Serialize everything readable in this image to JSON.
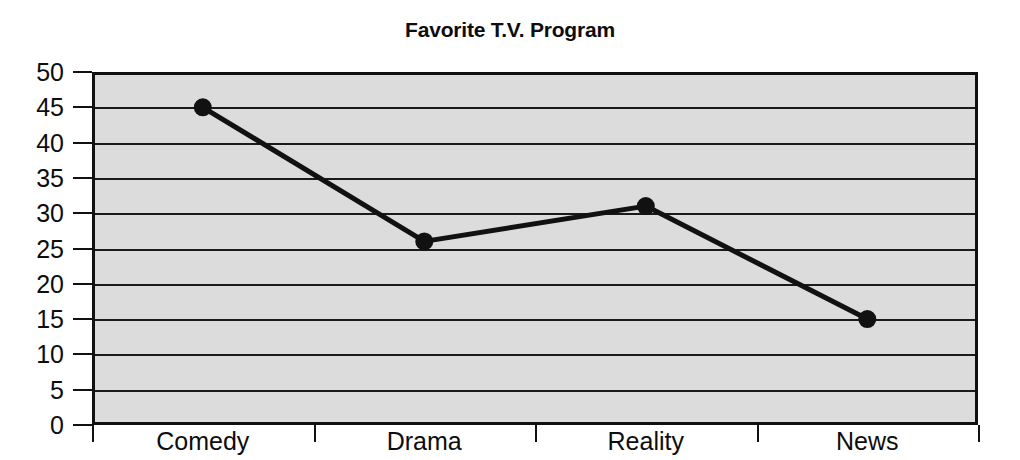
{
  "chart_data": {
    "type": "line",
    "title": "Favorite T.V. Program",
    "xlabel": "",
    "ylabel": "",
    "categories": [
      "Comedy",
      "Drama",
      "Reality",
      "News"
    ],
    "values": [
      45,
      26,
      31,
      15
    ],
    "series": [
      {
        "name": "Favorite T.V. Program",
        "values": [
          45,
          26,
          31,
          15
        ]
      }
    ],
    "ylim": [
      0,
      50
    ],
    "yticks": [
      0,
      5,
      10,
      15,
      20,
      25,
      30,
      35,
      40,
      45,
      50
    ],
    "ytick_labels": [
      "0",
      "5",
      "10",
      "15",
      "20",
      "25",
      "30",
      "35",
      "40",
      "45",
      "50"
    ],
    "grid": true,
    "grid_axis": "y",
    "legend": false,
    "legend_position": "none",
    "marker": "filled-circle",
    "colors": {
      "line": "#111111",
      "marker": "#111111",
      "plot_background": "#dcdcdc",
      "gridline": "#1a1a1a",
      "axis": "#111111",
      "figure_background": "#ffffff",
      "text": "#0d0d0d"
    }
  }
}
